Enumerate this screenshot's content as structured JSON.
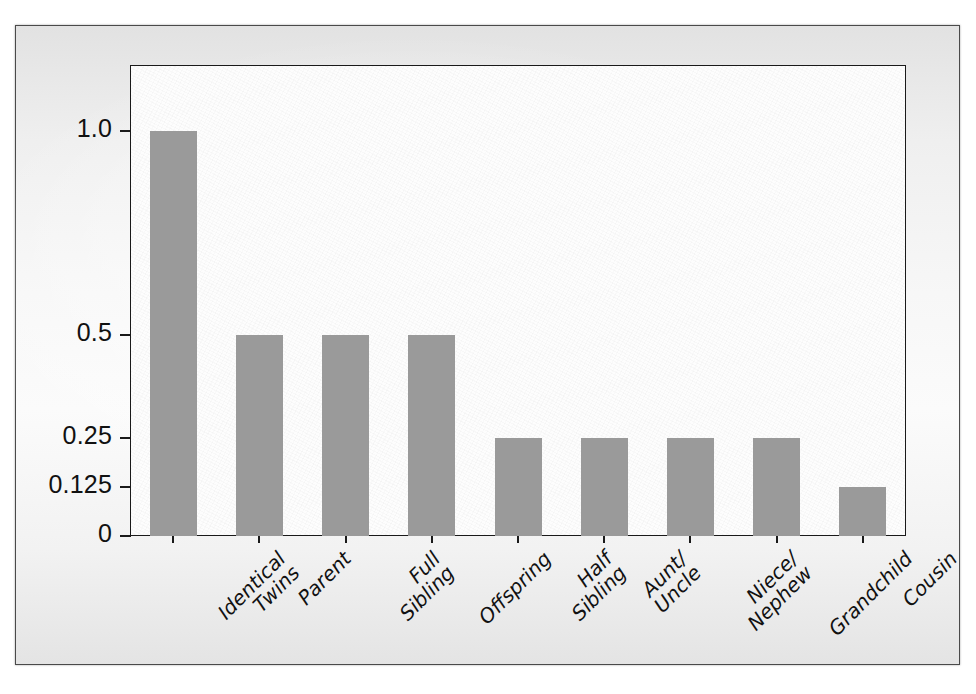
{
  "figure": {
    "background_color": "#f4f4f4",
    "plot_background_color": "#fdfdfd",
    "bar_color": "#9a9a9a",
    "axis_color": "#1a1a1a"
  },
  "chart_data": {
    "type": "bar",
    "title": "",
    "xlabel": "",
    "ylabel": "",
    "categories": [
      "Identical\nTwins",
      "Parent",
      "Full\nSibling",
      "Offspring",
      "Half\nSibling",
      "Aunt/\nUncle",
      "Niece/\nNephew",
      "Grandchild",
      "Cousin"
    ],
    "values": [
      1.0,
      0.5,
      0.5,
      0.5,
      0.25,
      0.25,
      0.25,
      0.25,
      0.125
    ],
    "ytick_labels": [
      "1.0",
      "0.5",
      "0.25",
      "0.125",
      "0"
    ],
    "ytick_values": [
      1.0,
      0.5,
      0.25,
      0.125,
      0
    ],
    "ylim": [
      0,
      1.16
    ],
    "grid": false,
    "legend": null,
    "series": [
      {
        "name": "Coefficient of relatedness",
        "values": [
          1.0,
          0.5,
          0.5,
          0.5,
          0.25,
          0.25,
          0.25,
          0.25,
          0.125
        ]
      }
    ]
  },
  "axis": {
    "y_labels": [
      {
        "text": "1.0",
        "value": 1.0
      },
      {
        "text": "0.5",
        "value": 0.5
      },
      {
        "text": "0.25",
        "value": 0.25
      },
      {
        "text": "0.125",
        "value": 0.125
      },
      {
        "text": "0",
        "value": 0
      }
    ],
    "x_labels": [
      {
        "line1": "Identical",
        "line2": "Twins"
      },
      {
        "line1": "Parent",
        "line2": ""
      },
      {
        "line1": "Full",
        "line2": "Sibling"
      },
      {
        "line1": "Offspring",
        "line2": ""
      },
      {
        "line1": "Half",
        "line2": "Sibling"
      },
      {
        "line1": "Aunt/",
        "line2": "Uncle"
      },
      {
        "line1": "Niece/",
        "line2": "Nephew"
      },
      {
        "line1": "Grandchild",
        "line2": ""
      },
      {
        "line1": "Cousin",
        "line2": ""
      }
    ]
  }
}
